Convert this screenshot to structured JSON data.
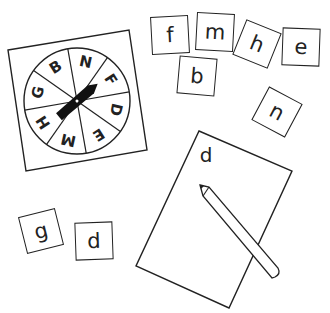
{
  "spinner": {
    "segments": [
      "B",
      "N",
      "F",
      "D",
      "E",
      "M",
      "H",
      "G"
    ]
  },
  "tiles": [
    {
      "letter": "f",
      "x": 151,
      "y": 16,
      "rot": -3
    },
    {
      "letter": "m",
      "x": 196,
      "y": 13,
      "rot": 3
    },
    {
      "letter": "h",
      "x": 238,
      "y": 25,
      "rot": 22
    },
    {
      "letter": "e",
      "x": 282,
      "y": 28,
      "rot": 2
    },
    {
      "letter": "b",
      "x": 178,
      "y": 57,
      "rot": 5
    },
    {
      "letter": "n",
      "x": 258,
      "y": 93,
      "rot": 28
    },
    {
      "letter": "g",
      "x": 22,
      "y": 212,
      "rot": -14
    },
    {
      "letter": "d",
      "x": 75,
      "y": 222,
      "rot": -2
    }
  ],
  "worksheet": {
    "written_letter": "d"
  }
}
